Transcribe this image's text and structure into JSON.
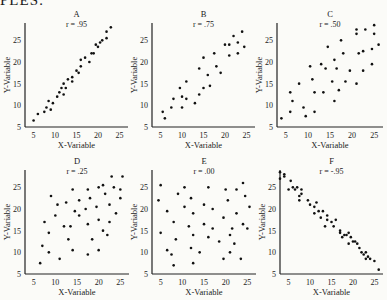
{
  "heading": "PLES:",
  "chart_data": [
    {
      "type": "scatter",
      "title": "A",
      "subtitle": "r = .95",
      "xlabel": "X-Variable",
      "ylabel": "Y-Variable",
      "xticks": [
        5,
        10,
        15,
        20,
        25
      ],
      "yticks": [
        5,
        10,
        15,
        20,
        25
      ],
      "xlim": [
        3,
        27
      ],
      "ylim": [
        5,
        29
      ],
      "points": [
        [
          5,
          6.5
        ],
        [
          6,
          8
        ],
        [
          7.5,
          8.5
        ],
        [
          8,
          9.5
        ],
        [
          9,
          9
        ],
        [
          8.5,
          11
        ],
        [
          9.5,
          10.5
        ],
        [
          10.5,
          12
        ],
        [
          11,
          13
        ],
        [
          11.5,
          14
        ],
        [
          12,
          12.5
        ],
        [
          12.5,
          14
        ],
        [
          12,
          15
        ],
        [
          13,
          16
        ],
        [
          14,
          15.5
        ],
        [
          14,
          16.5
        ],
        [
          15,
          18
        ],
        [
          15.5,
          17.5
        ],
        [
          16,
          19
        ],
        [
          16,
          20.5
        ],
        [
          17,
          21
        ],
        [
          18,
          20
        ],
        [
          18.5,
          22
        ],
        [
          19,
          22
        ],
        [
          19.5,
          24
        ],
        [
          20,
          23.5
        ],
        [
          20.5,
          24.5
        ],
        [
          21,
          25
        ],
        [
          22,
          25.5
        ],
        [
          22,
          27
        ],
        [
          23,
          28
        ]
      ]
    },
    {
      "type": "scatter",
      "title": "B",
      "subtitle": "r = .75",
      "xlabel": "X-Variable",
      "ylabel": "Y-Variable",
      "xticks": [
        5,
        10,
        15,
        20,
        25
      ],
      "yticks": [
        5,
        10,
        15,
        20,
        25
      ],
      "xlim": [
        3,
        27
      ],
      "ylim": [
        5,
        29
      ],
      "points": [
        [
          5.5,
          8.5
        ],
        [
          6,
          7
        ],
        [
          7.5,
          9.5
        ],
        [
          8,
          11.5
        ],
        [
          9.5,
          14
        ],
        [
          10,
          12
        ],
        [
          10,
          9.5
        ],
        [
          11,
          15.5
        ],
        [
          11,
          11.5
        ],
        [
          13,
          10.5
        ],
        [
          14,
          12.5
        ],
        [
          14,
          18.5
        ],
        [
          15,
          14
        ],
        [
          15,
          21
        ],
        [
          16,
          17
        ],
        [
          16.5,
          14.5
        ],
        [
          17.5,
          22
        ],
        [
          18,
          19
        ],
        [
          19,
          17.5
        ],
        [
          20,
          24
        ],
        [
          21,
          24
        ],
        [
          21,
          21.5
        ],
        [
          22,
          26
        ],
        [
          23,
          22
        ],
        [
          23,
          24.5
        ],
        [
          24,
          27
        ],
        [
          24.5,
          23.5
        ]
      ]
    },
    {
      "type": "scatter",
      "title": "C",
      "subtitle": "r = .50",
      "xlabel": "X-Variable",
      "ylabel": "Y-Variable",
      "xticks": [
        5,
        10,
        15,
        20,
        25
      ],
      "yticks": [
        5,
        10,
        15,
        20,
        25
      ],
      "xlim": [
        3,
        27
      ],
      "ylim": [
        5,
        29
      ],
      "points": [
        [
          4,
          7
        ],
        [
          6,
          8.5
        ],
        [
          6,
          13
        ],
        [
          6.5,
          11
        ],
        [
          8,
          15
        ],
        [
          9,
          9.5
        ],
        [
          9.5,
          7.5
        ],
        [
          10.5,
          19
        ],
        [
          11,
          16
        ],
        [
          11.5,
          13
        ],
        [
          11.5,
          8.5
        ],
        [
          13,
          19.5
        ],
        [
          13.5,
          13
        ],
        [
          14,
          18.5
        ],
        [
          14.5,
          23.5
        ],
        [
          15.5,
          15.5
        ],
        [
          16,
          20.5
        ],
        [
          16,
          11
        ],
        [
          16.5,
          18.5
        ],
        [
          17,
          13.5
        ],
        [
          17.5,
          25
        ],
        [
          18,
          22
        ],
        [
          18.5,
          15.5
        ],
        [
          19.5,
          18
        ],
        [
          21,
          26.5
        ],
        [
          21,
          27.5
        ],
        [
          21,
          15
        ],
        [
          21.5,
          22
        ],
        [
          22.5,
          18
        ],
        [
          22.5,
          22.5
        ],
        [
          23,
          27.5
        ],
        [
          24.5,
          19.5
        ],
        [
          24.5,
          23
        ],
        [
          25,
          26.5
        ],
        [
          25,
          28.5
        ],
        [
          26,
          24
        ]
      ]
    },
    {
      "type": "scatter",
      "title": "D",
      "subtitle": "r = .25",
      "xlabel": "X-Variable",
      "ylabel": "Y-Variable",
      "xticks": [
        5,
        10,
        15,
        20,
        25
      ],
      "yticks": [
        5,
        10,
        15,
        20,
        25
      ],
      "xlim": [
        3,
        27
      ],
      "ylim": [
        5,
        29
      ],
      "points": [
        [
          6.5,
          7.5
        ],
        [
          7,
          11.5
        ],
        [
          7.5,
          17
        ],
        [
          8.5,
          14.5
        ],
        [
          8.5,
          10
        ],
        [
          9,
          23
        ],
        [
          10,
          18.5
        ],
        [
          10.5,
          21
        ],
        [
          11,
          8.5
        ],
        [
          12,
          16
        ],
        [
          12.5,
          21.5
        ],
        [
          13,
          13
        ],
        [
          13.5,
          16
        ],
        [
          14,
          24.5
        ],
        [
          14,
          10.5
        ],
        [
          14.5,
          19.5
        ],
        [
          15.5,
          22
        ],
        [
          15.5,
          18.5
        ],
        [
          17,
          20
        ],
        [
          17.5,
          16.5
        ],
        [
          17.5,
          24.5
        ],
        [
          17.5,
          9.5
        ],
        [
          18,
          22.5
        ],
        [
          18.5,
          13
        ],
        [
          19.5,
          20.5
        ],
        [
          20,
          10.5
        ],
        [
          20,
          17.5
        ],
        [
          20,
          25
        ],
        [
          21,
          25.5
        ],
        [
          21,
          15
        ],
        [
          21.5,
          23.5
        ],
        [
          22,
          14
        ],
        [
          22.5,
          17
        ],
        [
          22.5,
          21
        ],
        [
          23,
          27.5
        ],
        [
          23.5,
          25
        ],
        [
          24,
          19
        ],
        [
          25,
          22.5
        ],
        [
          25,
          24.5
        ],
        [
          25.5,
          27.5
        ]
      ]
    },
    {
      "type": "scatter",
      "title": "E",
      "subtitle": "r = .00",
      "xlabel": "X-Variable",
      "ylabel": "Y-Variable",
      "xticks": [
        5,
        10,
        15,
        20,
        25
      ],
      "yticks": [
        5,
        10,
        15,
        20,
        25
      ],
      "xlim": [
        3,
        27
      ],
      "ylim": [
        5,
        29
      ],
      "points": [
        [
          4.5,
          22
        ],
        [
          5,
          25.5
        ],
        [
          5,
          14.5
        ],
        [
          6.5,
          10.5
        ],
        [
          6.5,
          19.5
        ],
        [
          7.5,
          9.5
        ],
        [
          8,
          17
        ],
        [
          8,
          7
        ],
        [
          8.5,
          13
        ],
        [
          9,
          23.5
        ],
        [
          10.5,
          25
        ],
        [
          10.5,
          20.5
        ],
        [
          11.5,
          16
        ],
        [
          12,
          22.5
        ],
        [
          12,
          11
        ],
        [
          12.5,
          19
        ],
        [
          12.5,
          7.5
        ],
        [
          12.5,
          14
        ],
        [
          14,
          10
        ],
        [
          15,
          16.5
        ],
        [
          15,
          21
        ],
        [
          16,
          13.5
        ],
        [
          16,
          25
        ],
        [
          17,
          15.5
        ],
        [
          17,
          20
        ],
        [
          18.5,
          12.5
        ],
        [
          19.5,
          8.5
        ],
        [
          19.5,
          18
        ],
        [
          20,
          24.5
        ],
        [
          20.5,
          22
        ],
        [
          21,
          14
        ],
        [
          21,
          10
        ],
        [
          21.5,
          15.5
        ],
        [
          22,
          12
        ],
        [
          22.5,
          19
        ],
        [
          22.5,
          24.5
        ],
        [
          23.5,
          8.5
        ],
        [
          24,
          16.5
        ],
        [
          24,
          26
        ],
        [
          24.5,
          23
        ],
        [
          25,
          15.5
        ],
        [
          25.5,
          20.5
        ]
      ]
    },
    {
      "type": "scatter",
      "title": "F",
      "subtitle": "r = -.95",
      "xlabel": "X-Variable",
      "ylabel": "Y-Variable",
      "xticks": [
        5,
        10,
        15,
        20,
        25
      ],
      "yticks": [
        5,
        10,
        15,
        20,
        25
      ],
      "xlim": [
        3,
        27
      ],
      "ylim": [
        5,
        29
      ],
      "points": [
        [
          3,
          28.5
        ],
        [
          3,
          27
        ],
        [
          4,
          27.5
        ],
        [
          4,
          28
        ],
        [
          5,
          24.5
        ],
        [
          5.5,
          26.5
        ],
        [
          6,
          25
        ],
        [
          6.5,
          24.5
        ],
        [
          7,
          25
        ],
        [
          7.5,
          23
        ],
        [
          7.5,
          22
        ],
        [
          8,
          24.5
        ],
        [
          8,
          23.5
        ],
        [
          9.5,
          22
        ],
        [
          10,
          21
        ],
        [
          11,
          20.5
        ],
        [
          11,
          19
        ],
        [
          11.5,
          21.5
        ],
        [
          12,
          19.5
        ],
        [
          12.5,
          18
        ],
        [
          13,
          19.5
        ],
        [
          13.5,
          16
        ],
        [
          14,
          17.5
        ],
        [
          14,
          18.5
        ],
        [
          15,
          17
        ],
        [
          15.5,
          16
        ],
        [
          16,
          17.5
        ],
        [
          17,
          15
        ],
        [
          17,
          14.5
        ],
        [
          17.5,
          13.5
        ],
        [
          18,
          14
        ],
        [
          18.5,
          14
        ],
        [
          19,
          14.5
        ],
        [
          19,
          12
        ],
        [
          19.5,
          13.5
        ],
        [
          20,
          12.5
        ],
        [
          20.5,
          12.5
        ],
        [
          21,
          12
        ],
        [
          21.5,
          11
        ],
        [
          22,
          10
        ],
        [
          22.5,
          9.5
        ],
        [
          23,
          8.5
        ],
        [
          23,
          10
        ],
        [
          23.5,
          9
        ],
        [
          24,
          8.5
        ],
        [
          25,
          8
        ],
        [
          26,
          6
        ]
      ]
    }
  ]
}
